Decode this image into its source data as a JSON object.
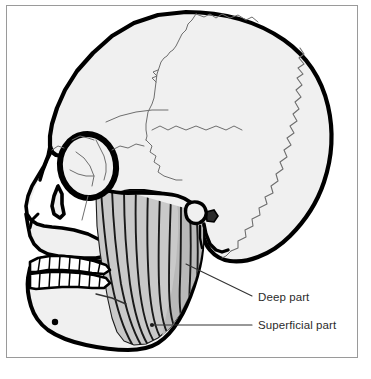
{
  "figure": {
    "kind": "anatomical-illustration",
    "background_color": "#ffffff",
    "frame_color": "#9a9a9a",
    "bone_fill_color": "#f0f0f0",
    "bone_outline_color": "#000000",
    "suture_line_color": "#6e6e6e",
    "muscle_fill_color": "#c9c9c9",
    "muscle_fiber_color": "#1a1a1a",
    "leader_line_color": "#333333",
    "label_text_color": "#2b2b2b"
  },
  "labels": [
    {
      "id": "deep",
      "text": "Deep part",
      "leader": {
        "x1": 186,
        "y1": 264,
        "x2": 252,
        "y2": 296,
        "marker": "none"
      }
    },
    {
      "id": "superficial",
      "text": "Superficial part",
      "leader": {
        "x1": 152,
        "y1": 325,
        "x2": 252,
        "y2": 325,
        "marker": "dot"
      }
    }
  ],
  "structures": [
    {
      "name": "cranial-vault",
      "note": "frontal, parietal and occipital bones"
    },
    {
      "name": "coronal-suture"
    },
    {
      "name": "lambdoid-suture"
    },
    {
      "name": "squamous-suture"
    },
    {
      "name": "orbit"
    },
    {
      "name": "nasal-aperture"
    },
    {
      "name": "zygomatic-arch"
    },
    {
      "name": "maxilla"
    },
    {
      "name": "mandible"
    },
    {
      "name": "mental-foramen"
    },
    {
      "name": "external-acoustic-meatus"
    },
    {
      "name": "mastoid-process"
    },
    {
      "name": "upper-teeth-row"
    },
    {
      "name": "lower-teeth-row"
    },
    {
      "name": "masseter-muscle"
    }
  ]
}
